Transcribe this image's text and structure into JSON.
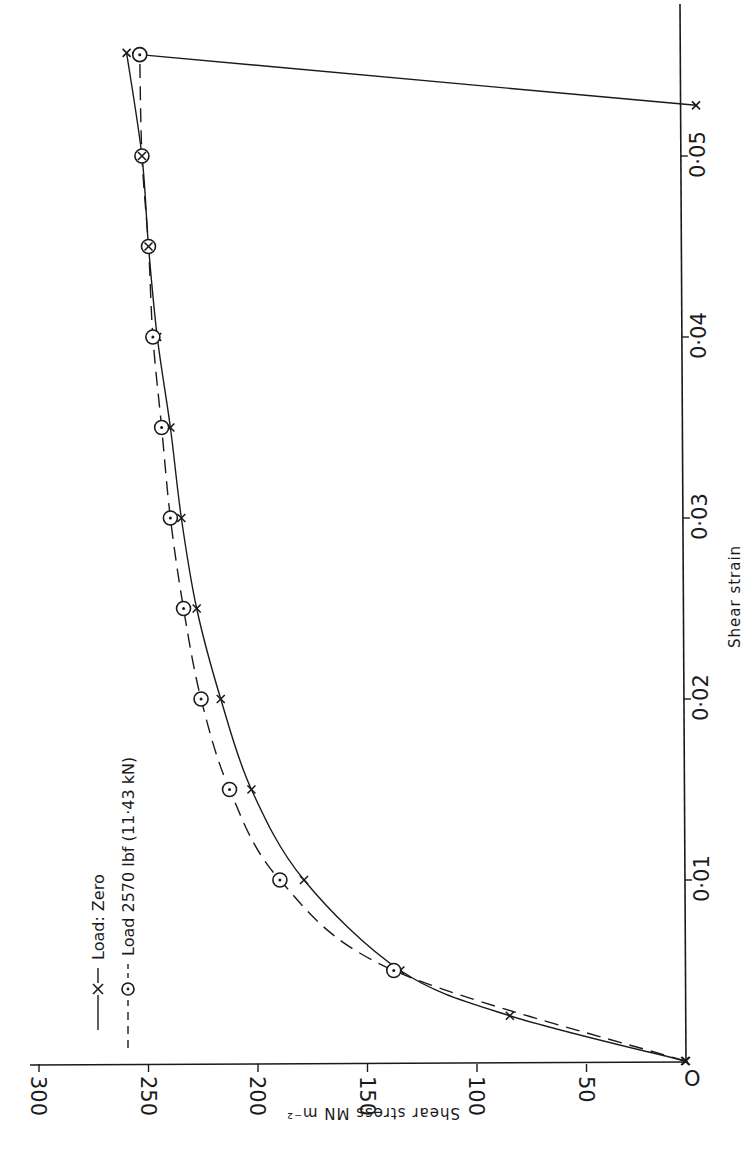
{
  "figure": {
    "orientation": "rotated 90 degrees counter-clockwise",
    "ink_color": "#1a1a1a",
    "background": "#ffffff"
  },
  "chart_data": {
    "type": "line",
    "title": "",
    "xlabel": "Shear strain",
    "ylabel": "Shear stress  MN m⁻²",
    "xlim": [
      0,
      0.056
    ],
    "ylim": [
      0,
      300
    ],
    "x_ticks": [
      "0",
      "0·01",
      "0·02",
      "0·03",
      "0·04",
      "0·05"
    ],
    "x_tick_values": [
      0,
      0.01,
      0.02,
      0.03,
      0.04,
      0.05
    ],
    "y_ticks": [
      "50",
      "100",
      "150",
      "200",
      "250",
      "300"
    ],
    "y_tick_values": [
      50,
      100,
      150,
      200,
      250,
      300
    ],
    "grid": false,
    "legend_position": "upper left (rotated)",
    "series": [
      {
        "name": "Load: Zero",
        "style": "solid",
        "marker": "x",
        "x": [
          0,
          0.0025,
          0.005,
          0.01,
          0.015,
          0.02,
          0.025,
          0.03,
          0.035,
          0.04,
          0.045,
          0.05,
          0.0557
        ],
        "y": [
          5,
          85,
          135,
          179,
          203,
          217,
          228,
          235,
          240,
          246,
          250,
          253,
          260
        ]
      },
      {
        "name": "Load 2570 lbf (11·43 kN)",
        "style": "dashed",
        "marker": "circle-dot",
        "x": [
          0.005,
          0.01,
          0.015,
          0.02,
          0.025,
          0.03,
          0.035,
          0.04,
          0.045,
          0.05,
          0.0556
        ],
        "y": [
          138,
          190,
          213,
          226,
          234,
          240,
          244,
          248,
          250,
          253,
          254
        ]
      },
      {
        "name": "Unloading",
        "style": "solid",
        "marker": "x",
        "x": [
          0.0556,
          0.0528
        ],
        "y": [
          254,
          0
        ]
      }
    ],
    "annotations": [
      "Points at strain 0.045 and 0.05 coincide (⊗)"
    ]
  },
  "axes": {
    "x_title": "Shear strain",
    "y_title": "Shear stress  MN m⁻²",
    "origin_label": "O"
  },
  "legend": {
    "items": [
      {
        "label": "Load: Zero",
        "style": "solid",
        "marker": "x"
      },
      {
        "label": "Load 2570 lbf (11·43 kN)",
        "style": "dashed",
        "marker": "circle-dot"
      }
    ]
  }
}
